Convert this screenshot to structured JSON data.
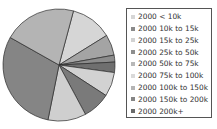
{
  "chart_data": {
    "type": "pie",
    "title": "",
    "start_angle_deg": 15,
    "direction": "clockwise",
    "categories": [
      "2000 < 10k",
      "2000 10k to 15k",
      "2000 15k to 25k",
      "2000 25k to 50k",
      "2000 50k to 75k",
      "2000 75k to 100k",
      "2000 100k to 150k",
      "2000 150k to 200k",
      "2000 200k+"
    ],
    "values": [
      12,
      6,
      2,
      3,
      7,
      8,
      11,
      30,
      21
    ],
    "colors": [
      "#d6d6d6",
      "#a4a4a4",
      "#8c8c8c",
      "#6f6f6f",
      "#d2d2d2",
      "#7a7a7a",
      "#cfcfcf",
      "#858585",
      "#b4b4b4"
    ],
    "legend_position": "right"
  },
  "legend": {
    "items": [
      {
        "label": "2000 < 10k",
        "color": "#d6d6d6"
      },
      {
        "label": "2000 10k to 15k",
        "color": "#8a8a8a"
      },
      {
        "label": "2000 15k to 25k",
        "color": "#d2d2d2"
      },
      {
        "label": "2000 25k to 50k",
        "color": "#8e8e8e"
      },
      {
        "label": "2000 50k to 75k",
        "color": "#b8b8b8"
      },
      {
        "label": "2000 75k to 100k",
        "color": "#dadada"
      },
      {
        "label": "2000 100k to 150k",
        "color": "#b4b4b4"
      },
      {
        "label": "2000 150k to 200k",
        "color": "#858585"
      },
      {
        "label": "2000 200k+",
        "color": "#6a6a6a"
      }
    ]
  }
}
